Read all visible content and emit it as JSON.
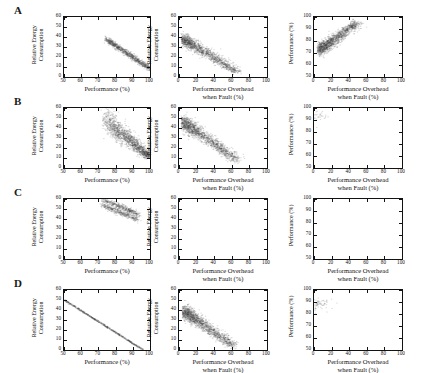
{
  "figure": {
    "rows": [
      {
        "label": "A"
      },
      {
        "label": "B"
      },
      {
        "label": "C"
      },
      {
        "label": "D"
      }
    ],
    "axis_titles": {
      "energy_y": [
        "Relative Energy",
        "Consumption"
      ],
      "performance_y": "Performance (%)",
      "performance_x": "Performance (%)",
      "overhead_x": [
        "Performance Overhead",
        "when Fault (%)"
      ]
    },
    "ticks": {
      "perf_x": [
        "50",
        "60",
        "70",
        "80",
        "90",
        "100"
      ],
      "overhead_x": [
        "0",
        "20",
        "40",
        "60",
        "80",
        "100"
      ],
      "energy_y": [
        "0",
        "10",
        "20",
        "30",
        "40",
        "50",
        "60"
      ],
      "perf_y": [
        "50",
        "60",
        "70",
        "80",
        "90",
        "100"
      ]
    },
    "marker_color": "#3b3b3b"
  },
  "chart_data": [
    {
      "id": "A1",
      "type": "scatter",
      "row": "A",
      "col": 0,
      "xlabel": "Performance (%)",
      "ylabel": "Relative Energy Consumption",
      "xlim": [
        50,
        100
      ],
      "ylim": [
        0,
        60
      ],
      "grid": false,
      "legend": null,
      "n_points": 900,
      "description": "Narrow tight band decreasing linearly from (74,38) to (100,8)",
      "cloud": {
        "x0": 74,
        "y0": 38,
        "x1": 100,
        "y1": 8,
        "spread_y": 1.6,
        "spread_x": 0.6,
        "shape": "band"
      }
    },
    {
      "id": "A2",
      "type": "scatter",
      "row": "A",
      "col": 1,
      "xlabel": "Performance Overhead when Fault (%)",
      "ylabel": "Relative Energy Consumption",
      "xlim": [
        0,
        100
      ],
      "ylim": [
        0,
        60
      ],
      "grid": false,
      "legend": null,
      "n_points": 1400,
      "description": "Dense wedge from upper-left (2,38) decaying to (62,4), tail to 80",
      "cloud": {
        "x0": 2,
        "y0": 37,
        "x1": 62,
        "y1": 5,
        "spread_y": 6.5,
        "spread_x": 9,
        "shape": "wedge"
      }
    },
    {
      "id": "A3",
      "type": "scatter",
      "row": "A",
      "col": 2,
      "xlabel": "Performance Overhead when Fault (%)",
      "ylabel": "Performance (%)",
      "xlim": [
        0,
        100
      ],
      "ylim": [
        50,
        100
      ],
      "grid": false,
      "legend": null,
      "n_points": 1400,
      "description": "Rising cloud from (3,72) to (45,95), saturating near 97, sparse tail to 75",
      "cloud": {
        "x0": 3,
        "y0": 73,
        "x1": 45,
        "y1": 95,
        "spread_y": 5.5,
        "spread_x": 9,
        "shape": "rise"
      }
    },
    {
      "id": "B1",
      "type": "scatter",
      "row": "B",
      "col": 0,
      "xlabel": "Performance (%)",
      "ylabel": "Relative Energy Consumption",
      "xlim": [
        50,
        100
      ],
      "ylim": [
        0,
        60
      ],
      "grid": false,
      "legend": null,
      "n_points": 1500,
      "description": "Broad fan from (74,52) narrowing to (100,10)",
      "cloud": {
        "x0": 74,
        "y0": 46,
        "x1": 100,
        "y1": 10,
        "spread_y": 7,
        "spread_x": 1.5,
        "shape": "fan"
      }
    },
    {
      "id": "B2",
      "type": "scatter",
      "row": "B",
      "col": 1,
      "xlabel": "Performance Overhead when Fault (%)",
      "ylabel": "Relative Energy Consumption",
      "xlim": [
        0,
        100
      ],
      "ylim": [
        0,
        60
      ],
      "grid": false,
      "legend": null,
      "n_points": 1500,
      "description": "Wedge from (2,47) decaying to (60,8), peak density near x=15",
      "cloud": {
        "x0": 2,
        "y0": 45,
        "x1": 62,
        "y1": 8,
        "spread_y": 8,
        "spread_x": 9,
        "shape": "wedge"
      }
    },
    {
      "id": "B3",
      "type": "scatter",
      "row": "B",
      "col": 2,
      "xlabel": "Performance Overhead when Fault (%)",
      "ylabel": "Performance (%)",
      "xlim": [
        50,
        100
      ],
      "ylim": [
        50,
        100
      ],
      "grid": false,
      "legend": null,
      "n_points": 1500,
      "description": "Rising cloud from (3,73) to (45,96), tail to x=70",
      "cloud": {
        "x0": 3,
        "y0": 73,
        "x1": 45,
        "y1": 95,
        "spread_y": 6,
        "spread_x": 9.5,
        "shape": "rise"
      }
    },
    {
      "id": "C1",
      "type": "scatter",
      "row": "C",
      "col": 0,
      "xlabel": "Performance (%)",
      "ylabel": "Relative Energy Consumption",
      "xlim": [
        50,
        100
      ],
      "ylim": [
        0,
        60
      ],
      "grid": false,
      "legend": null,
      "n_points": 800,
      "description": "Two parallel descending bands in upper region from (72,58) to (92,40)",
      "cloud": {
        "x0": 72,
        "y0": 57,
        "x1": 93,
        "y1": 42,
        "spread_y": 1.4,
        "spread_x": 0.8,
        "shape": "double-band"
      }
    },
    {
      "id": "C2",
      "type": "scatter",
      "row": "C",
      "col": 1,
      "xlabel": "Performance Overhead when Fault (%)",
      "ylabel": "Relative Energy Consumption",
      "xlim": [
        0,
        100
      ],
      "ylim": [
        0,
        60
      ],
      "grid": false,
      "legend": null,
      "n_points": 0,
      "description": "Empty panel - no data plotted",
      "cloud": null
    },
    {
      "id": "C3",
      "type": "scatter",
      "row": "C",
      "col": 2,
      "xlabel": "Performance Overhead when Fault (%)",
      "ylabel": "Performance (%)",
      "xlim": [
        0,
        100
      ],
      "ylim": [
        50,
        100
      ],
      "grid": false,
      "legend": null,
      "n_points": 0,
      "description": "Empty panel - no data plotted",
      "cloud": null
    },
    {
      "id": "D1",
      "type": "scatter",
      "row": "D",
      "col": 0,
      "xlabel": "Performance (%)",
      "ylabel": "Relative Energy Consumption",
      "xlim": [
        50,
        100
      ],
      "ylim": [
        0,
        60
      ],
      "grid": false,
      "legend": null,
      "n_points": 600,
      "description": "Near-perfect thin straight line from (50,50) to (96,0)",
      "cloud": {
        "x0": 50,
        "y0": 50,
        "x1": 96,
        "y1": 0,
        "spread_y": 0.35,
        "spread_x": 0.3,
        "shape": "line"
      }
    },
    {
      "id": "D2",
      "type": "scatter",
      "row": "D",
      "col": 1,
      "xlabel": "Performance Overhead when Fault (%)",
      "ylabel": "Relative Energy Consumption",
      "xlim": [
        0,
        100
      ],
      "ylim": [
        0,
        60
      ],
      "grid": false,
      "legend": null,
      "n_points": 1500,
      "description": "Dense wedge from (3,40) decaying to (55,3), tail to x=85",
      "cloud": {
        "x0": 3,
        "y0": 38,
        "x1": 58,
        "y1": 4,
        "spread_y": 7.5,
        "spread_x": 8.5,
        "shape": "wedge"
      }
    },
    {
      "id": "D3",
      "type": "scatter",
      "row": "D",
      "col": 2,
      "xlabel": "Performance Overhead when Fault (%)",
      "ylabel": "Performance (%)",
      "xlim": [
        50,
        100
      ],
      "ylim": [
        50,
        100
      ],
      "grid": false,
      "legend": null,
      "n_points": 1500,
      "description": "Rising cloud from (3,55) to (48,92), broad vertical spread at left",
      "cloud": {
        "x0": 3,
        "y0": 58,
        "x1": 48,
        "y1": 90,
        "spread_y": 7.5,
        "spread_x": 9,
        "shape": "rise"
      }
    }
  ]
}
